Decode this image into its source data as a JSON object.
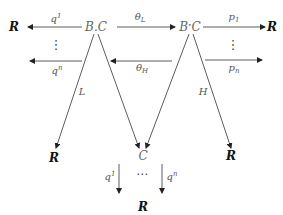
{
  "diagram": {
    "nodes": {
      "r_top_left": "R",
      "bc_left": "B",
      "bc_left_dot": ".",
      "bc_left_c": "C",
      "bc_right": "B",
      "bc_right_dot": "•",
      "bc_right_c": "C",
      "r_top_right": "R",
      "r_mid_left": "R",
      "c_center": "C",
      "r_mid_right": "R",
      "r_bottom": "R"
    },
    "edge_labels": {
      "q1_top": "q",
      "q1_top_sup": "1",
      "qn_left": "q",
      "qn_left_sup": "n",
      "theta_l": "θ",
      "theta_l_sub": "L",
      "theta_h": "θ",
      "theta_h_sub": "H",
      "p1": "p",
      "p1_sub": "1",
      "pn": "p",
      "pn_sub": "n",
      "l_diag": "L",
      "h_diag": "H",
      "q1_bottom": "q",
      "q1_bottom_sup": "1",
      "qn_bottom": "q",
      "qn_bottom_sup": "n"
    },
    "ellipses": {
      "vdots_left": "⋮",
      "vdots_right": "⋮",
      "hdots_bottom": "⋯"
    }
  }
}
